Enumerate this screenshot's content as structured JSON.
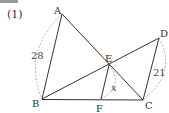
{
  "problem": {
    "label": "(1)"
  },
  "diagram": {
    "points": {
      "A": {
        "x": 62,
        "y": 14
      },
      "B": {
        "x": 42,
        "y": 99
      },
      "C": {
        "x": 143,
        "y": 100
      },
      "D": {
        "x": 159,
        "y": 38
      },
      "E": {
        "x": 109,
        "y": 65
      },
      "F": {
        "x": 101,
        "y": 99
      }
    },
    "labels": {
      "A": "A",
      "B": "B",
      "C": "C",
      "D": "D",
      "E": "E",
      "F": "F"
    },
    "measures": {
      "AB": "28",
      "DC": "21",
      "EF": "x"
    },
    "segments": [
      "AB",
      "AC",
      "BD",
      "DC",
      "BC",
      "EF"
    ],
    "colors": {
      "line": "#333333",
      "dashed": "#999999"
    }
  }
}
